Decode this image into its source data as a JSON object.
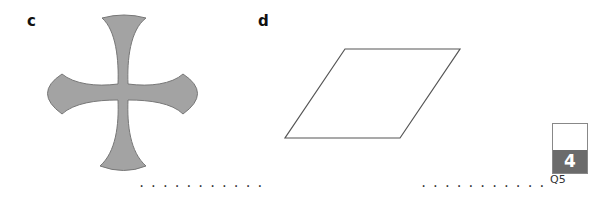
{
  "parts": [
    {
      "label": "c",
      "shape": "cross-with-concave-flared-arms",
      "fill": "#a3a3a3",
      "stroke": "#777777",
      "answer_line": "..........."
    },
    {
      "label": "d",
      "shape": "parallelogram",
      "fill": "#ffffff",
      "stroke": "#555555",
      "answer_line": "..........."
    }
  ],
  "marks": {
    "score": "4",
    "question": "Q5"
  }
}
